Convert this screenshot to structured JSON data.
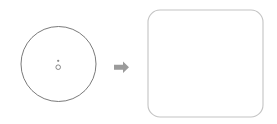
{
  "canvas": {
    "width": 277,
    "height": 124,
    "background_color": "#ffffff",
    "title": "Circle transforms into rounded square"
  },
  "figure": {
    "type": "transformation-diagram",
    "caption": "",
    "source_shape": {
      "name": "circle",
      "label": "",
      "center_x": 58.5,
      "center_y": 64,
      "radius": 37.5,
      "stroke_color": "#6b6b6b",
      "stroke_width": 0.9,
      "fill_color": "none"
    },
    "source_shape_marks": [
      {
        "name": "center-dot",
        "shape": "filled-dot",
        "center_x": 58.2,
        "center_y": 60.8,
        "radius": 1.15,
        "fill_color": "#8a8a8a",
        "stroke_color": "none"
      },
      {
        "name": "center-ring",
        "shape": "open-circle",
        "center_x": 58.2,
        "center_y": 67.2,
        "radius": 2.3,
        "fill_color": "none",
        "stroke_color": "#7c7c7c",
        "stroke_width": 0.9
      }
    ],
    "connector": {
      "name": "arrow",
      "direction": "right",
      "label": "",
      "color": "#9b9b9b",
      "shaft_x": 114,
      "shaft_y": 61.5,
      "shaft_width": 9,
      "shaft_height": 5,
      "head_width": 6,
      "head_height": 11.5,
      "tip_x": 129,
      "tip_y": 67.2
    },
    "target_shape": {
      "name": "rounded-square",
      "label": "",
      "x": 148,
      "y": 10,
      "width": 115,
      "height": 107,
      "corner_radius": 12,
      "stroke_color": "#c4c4c4",
      "stroke_width": 1.1,
      "fill_color": "#ffffff"
    }
  },
  "colors": {
    "background": "#ffffff",
    "circle_stroke": "#6b6b6b",
    "square_stroke": "#c4c4c4",
    "arrow_fill": "#9b9b9b",
    "mark_fill": "#8a8a8a"
  }
}
